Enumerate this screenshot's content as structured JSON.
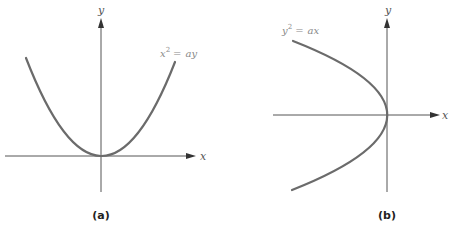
{
  "figure": {
    "panels": [
      {
        "id": "a",
        "caption": "(a)",
        "equation": {
          "base": "x",
          "exponent": "2",
          "operator": "=",
          "rhs": "ay"
        },
        "axes": {
          "x_label": "x",
          "y_label": "y"
        },
        "curve": {
          "type": "parabola",
          "opens": "up",
          "vertex": "origin"
        }
      },
      {
        "id": "b",
        "caption": "(b)",
        "equation": {
          "base": "y",
          "exponent": "2",
          "operator": "=",
          "rhs": "ax"
        },
        "axes": {
          "x_label": "x",
          "y_label": "y"
        },
        "curve": {
          "type": "parabola",
          "opens": "left",
          "vertex": "origin"
        }
      }
    ],
    "colors": {
      "curve": "#6b6b6b",
      "axis": "#555555",
      "label": "#888888",
      "caption": "#222222"
    }
  }
}
